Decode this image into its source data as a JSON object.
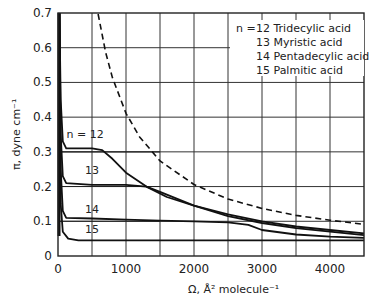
{
  "chart_data": {
    "type": "line",
    "title": "",
    "xlabel": "Ω, Å² molecule⁻¹",
    "ylabel": "π, dyne cm⁻¹",
    "xlim": [
      0,
      4500
    ],
    "ylim": [
      0,
      0.7
    ],
    "xticks": [
      0,
      1000,
      2000,
      3000,
      4000
    ],
    "yticks": [
      0,
      0.1,
      0.2,
      0.3,
      0.4,
      0.5,
      0.6,
      0.7
    ],
    "xtick_labels": [
      "0",
      "1000",
      "2000",
      "3000",
      "4000"
    ],
    "ytick_labels": [
      "0",
      "0.1",
      "0.2",
      "0.3",
      "0.4",
      "0.5",
      "0.6",
      "0.7"
    ],
    "grid": true,
    "grid_x_step": 500,
    "grid_y_step": 0.1,
    "legend": {
      "position": "upper right",
      "prefix": "n =",
      "entries": [
        "12 Tridecylic acid",
        "13 Myristic acid",
        "14 Pentadecylic acid",
        "15 Palmitic acid"
      ]
    },
    "annotations": [
      {
        "text": "n = 12",
        "x": 400,
        "y": 0.34
      },
      {
        "text": "13",
        "x": 500,
        "y": 0.235
      },
      {
        "text": "14",
        "x": 500,
        "y": 0.125
      },
      {
        "text": "15",
        "x": 500,
        "y": 0.065
      }
    ],
    "series": [
      {
        "name": "n = 12 Tridecylic acid",
        "style": "solid",
        "x": [
          20,
          40,
          70,
          120,
          300,
          500,
          650,
          800,
          1000,
          1300,
          1600,
          2000,
          2500,
          3000,
          3500,
          4000,
          4500
        ],
        "y": [
          0.7,
          0.45,
          0.33,
          0.31,
          0.31,
          0.31,
          0.305,
          0.28,
          0.24,
          0.2,
          0.17,
          0.145,
          0.12,
          0.1,
          0.085,
          0.075,
          0.065
        ]
      },
      {
        "name": "n = 13 Myristic acid",
        "style": "solid",
        "x": [
          20,
          40,
          70,
          120,
          500,
          1000,
          1300,
          1500,
          2000,
          2500,
          3000,
          3500,
          4000,
          4500
        ],
        "y": [
          0.7,
          0.35,
          0.23,
          0.21,
          0.205,
          0.205,
          0.2,
          0.185,
          0.145,
          0.115,
          0.095,
          0.08,
          0.07,
          0.06
        ]
      },
      {
        "name": "n = 14 Pentadecylic acid",
        "style": "solid",
        "x": [
          20,
          40,
          70,
          120,
          500,
          1000,
          1500,
          2000,
          2500,
          2800,
          3000,
          3500,
          4000,
          4500
        ],
        "y": [
          0.7,
          0.25,
          0.13,
          0.11,
          0.108,
          0.105,
          0.102,
          0.1,
          0.097,
          0.09,
          0.075,
          0.062,
          0.056,
          0.052
        ]
      },
      {
        "name": "n = 15 Palmitic acid",
        "style": "solid",
        "x": [
          20,
          40,
          70,
          150,
          300,
          1000,
          2000,
          3000,
          4000,
          4500
        ],
        "y": [
          0.7,
          0.15,
          0.07,
          0.05,
          0.045,
          0.045,
          0.045,
          0.045,
          0.045,
          0.045
        ]
      },
      {
        "name": "ideal gas (π = kT/Ω)",
        "style": "dashed",
        "x": [
          590,
          700,
          800,
          1000,
          1200,
          1500,
          2000,
          2500,
          3000,
          3500,
          4000,
          4500
        ],
        "y": [
          0.697,
          0.587,
          0.514,
          0.411,
          0.343,
          0.274,
          0.206,
          0.164,
          0.137,
          0.117,
          0.103,
          0.091
        ]
      }
    ],
    "plateau_markers": [
      {
        "series": "n = 12",
        "y": 0.3,
        "x_end": 1500
      },
      {
        "series": "n = 13",
        "y": 0.2,
        "x_end": 1500
      },
      {
        "series": "n = 14",
        "y": 0.1,
        "x_end": 1500
      }
    ]
  }
}
